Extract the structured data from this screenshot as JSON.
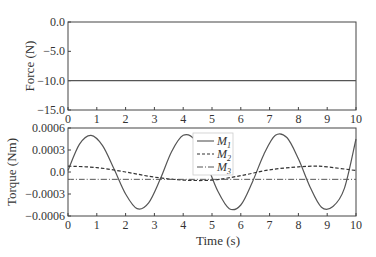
{
  "chart_data": [
    {
      "type": "line",
      "title": "",
      "xlabel": "",
      "ylabel": "Force (N)",
      "xlim": [
        0,
        10
      ],
      "ylim": [
        -15.0,
        0.0
      ],
      "xticks": [
        "0",
        "1",
        "2",
        "3",
        "4",
        "5",
        "6",
        "7",
        "8",
        "9",
        "10"
      ],
      "yticks": [
        "0.0",
        "-5.0",
        "-10.0",
        "-15.0"
      ],
      "ytick_values": [
        0.0,
        -5.0,
        -10.0,
        -15.0
      ],
      "grid": false,
      "series": [
        {
          "name": "Force",
          "style": "solid",
          "x": [
            0,
            10
          ],
          "values": [
            -10.0,
            -10.0
          ]
        }
      ]
    },
    {
      "type": "line",
      "title": "",
      "xlabel": "Time (s)",
      "ylabel": "Torque (Nm)",
      "xlim": [
        0,
        10
      ],
      "ylim": [
        -0.0006,
        0.0006
      ],
      "xticks": [
        "0",
        "1",
        "2",
        "3",
        "4",
        "5",
        "6",
        "7",
        "8",
        "9",
        "10"
      ],
      "yticks": [
        "0.0006",
        "0.0003",
        "0.0",
        "-0.0003",
        "-0.0006"
      ],
      "ytick_values": [
        0.0006,
        0.0003,
        0.0,
        -0.0003,
        -0.0006
      ],
      "grid": false,
      "legend_position": "upper center",
      "series": [
        {
          "name": "M1",
          "style": "solid",
          "x": [
            0,
            0.4,
            0.8,
            1.2,
            1.6,
            2.0,
            2.4,
            2.8,
            3.2,
            3.6,
            4.0,
            4.4,
            4.8,
            5.2,
            5.6,
            6.0,
            6.4,
            6.8,
            7.2,
            7.6,
            8.0,
            8.4,
            8.8,
            9.2,
            9.6,
            10.0
          ],
          "values": [
            2e-05,
            0.00038,
            0.0005,
            0.00036,
            4e-05,
            -0.0003,
            -0.0005,
            -0.00042,
            -0.0001,
            0.00028,
            0.0005,
            0.00044,
            0.00012,
            -0.00026,
            -0.0005,
            -0.00045,
            -0.00014,
            0.00024,
            0.0005,
            0.00047,
            0.00018,
            -0.0002,
            -0.00048,
            -0.00047,
            -0.00022,
            0.00045
          ]
        },
        {
          "name": "M2",
          "style": "dashed",
          "x": [
            0,
            1,
            2,
            3,
            4,
            5,
            6,
            7,
            8,
            8.6,
            9,
            10
          ],
          "values": [
            8e-05,
            6e-05,
            0.0,
            -7e-05,
            -0.00011,
            -0.00011,
            -5e-05,
            3e-05,
            7e-05,
            8e-05,
            7e-05,
            2e-05
          ]
        },
        {
          "name": "M3",
          "style": "dashdot",
          "x": [
            0,
            10
          ],
          "values": [
            -0.0001,
            -0.0001
          ]
        }
      ]
    }
  ],
  "legend": {
    "items": [
      {
        "label": "M",
        "sub": "1"
      },
      {
        "label": "M",
        "sub": "2"
      },
      {
        "label": "M",
        "sub": "3"
      }
    ]
  }
}
